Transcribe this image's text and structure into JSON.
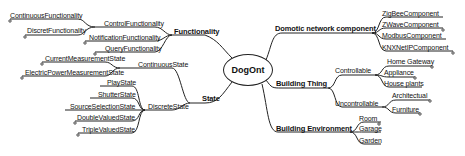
{
  "root": {
    "label": "DogOnt"
  },
  "left": {
    "functionality": {
      "label": "Functionality",
      "children": {
        "control": {
          "label": "ControlFunctionality",
          "children": [
            "ContinuousFunctionality",
            "DiscretFunctionality"
          ]
        },
        "notification": {
          "label": "NotificationFunctionality"
        },
        "query": {
          "label": "QueryFunctionality"
        }
      }
    },
    "state": {
      "label": "State",
      "children": {
        "continuous": {
          "label": "ContinuousState",
          "children": [
            "CurrentMeasurementState",
            "ElectricPowerMeasurementState"
          ]
        },
        "discrete": {
          "label": "DiscreteState",
          "children": [
            "PlayState",
            "ShutterState",
            "SourceSelectionState",
            "DoubleValuedState",
            "TripleValuedState"
          ]
        }
      }
    }
  },
  "right": {
    "domotic": {
      "label": "Domotic network component",
      "children": [
        "ZigBeeComponent",
        "ZWaveComponent",
        "ModbusComponent",
        "KNXNetIPComponent"
      ]
    },
    "thing": {
      "label": "Building Thing",
      "children": {
        "controllable": {
          "label": "Controllable",
          "children": [
            "Home Gateway",
            "Appliance",
            "House plants"
          ]
        },
        "uncontrollable": {
          "label": "Uncontrollable",
          "children": [
            "Architectual",
            "Furniture"
          ]
        }
      }
    },
    "environment": {
      "label": "Building Environment",
      "children": [
        "Room",
        "Garage",
        "Garden"
      ]
    }
  }
}
